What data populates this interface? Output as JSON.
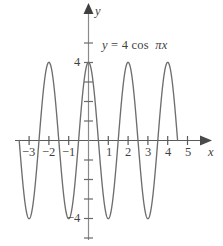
{
  "figure": {
    "kind": "cartesian-graph",
    "background_color": "#ffffff",
    "curve_color": "#6e6e6e",
    "axis_color": "#5a5a5a",
    "text_color": "#3f3f3f"
  },
  "equation_label": {
    "full_text": "y = 4 cos πx",
    "lhs": "y",
    "equals": "=",
    "amplitude": "4",
    "function": "cos",
    "argument": "πx"
  },
  "axes": {
    "x_axis_name": "x",
    "y_axis_name": "y",
    "x_ticks": [
      {
        "value": -3,
        "label": "−3"
      },
      {
        "value": -2,
        "label": "−2"
      },
      {
        "value": -1,
        "label": "−1"
      },
      {
        "value": 1,
        "label": "1"
      },
      {
        "value": 2,
        "label": "2"
      },
      {
        "value": 3,
        "label": "3"
      },
      {
        "value": 4,
        "label": "4"
      },
      {
        "value": 5,
        "label": "5"
      }
    ],
    "y_ticks": [
      {
        "value": 4,
        "label": "4"
      },
      {
        "value": -4,
        "label": "−4"
      }
    ],
    "y_unlabeled_tick_values": [
      6,
      5,
      3,
      2,
      1,
      -1,
      -2,
      -3,
      -5,
      -6
    ],
    "x_range": [
      -4.0,
      5.9
    ],
    "y_range": [
      -6.6,
      6.6
    ],
    "grid": false,
    "arrowheads": [
      "x-positive",
      "y-positive"
    ]
  },
  "chart_data": {
    "type": "line",
    "title": "",
    "subtitle": "",
    "xlabel": "x",
    "ylabel": "y",
    "xlim": [
      -4.0,
      5.9
    ],
    "ylim": [
      -6.6,
      6.6
    ],
    "grid": false,
    "legend": "none",
    "annotations": [
      "y = 4 cos πx"
    ],
    "series": [
      {
        "name": "y = 4 cos πx",
        "equation": "y = 4*cos(pi*x)",
        "amplitude": 4,
        "period": 2,
        "phase_shift": 0,
        "vertical_shift": 0,
        "color": "#6e6e6e",
        "domain_drawn": [
          -3.5,
          4.5
        ],
        "maxima": [
          {
            "x": -2,
            "y": 4
          },
          {
            "x": 0,
            "y": 4
          },
          {
            "x": 2,
            "y": 4
          },
          {
            "x": 4,
            "y": 4
          }
        ],
        "minima": [
          {
            "x": -3,
            "y": -4
          },
          {
            "x": -1,
            "y": -4
          },
          {
            "x": 1,
            "y": -4
          },
          {
            "x": 3,
            "y": -4
          }
        ],
        "x_intercepts": [
          -3.5,
          -2.5,
          -1.5,
          -0.5,
          0.5,
          1.5,
          2.5,
          3.5,
          4.5
        ]
      }
    ]
  }
}
